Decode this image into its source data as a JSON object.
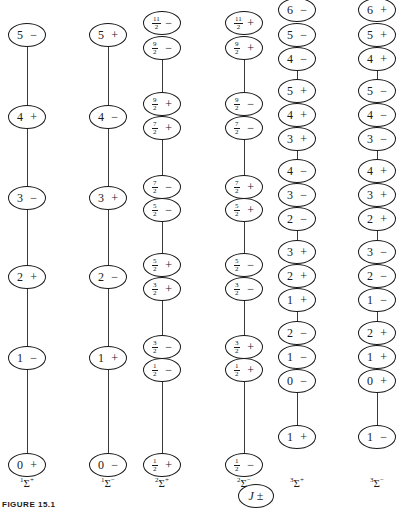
{
  "figure": {
    "caption": "FIGURE 15.1",
    "legend_node": "J ±"
  },
  "columns": [
    {
      "label": "Σ",
      "label_pre": "1",
      "label_post": "+",
      "x": 27,
      "levels": [
        {
          "j": "5",
          "p": "−",
          "y": 35
        },
        {
          "j": "4",
          "p": "+",
          "y": 117
        },
        {
          "j": "3",
          "p": "−",
          "y": 198
        },
        {
          "j": "2",
          "p": "+",
          "y": 277
        },
        {
          "j": "1",
          "p": "−",
          "y": 358
        },
        {
          "j": "0",
          "p": "+",
          "y": 465
        }
      ],
      "segments": [
        [
          35,
          465
        ]
      ]
    },
    {
      "label": "Σ",
      "label_pre": "1",
      "label_post": "−",
      "x": 108,
      "levels": [
        {
          "j": "5",
          "p": "+",
          "y": 35
        },
        {
          "j": "4",
          "p": "−",
          "y": 117
        },
        {
          "j": "3",
          "p": "+",
          "y": 198
        },
        {
          "j": "2",
          "p": "−",
          "y": 277
        },
        {
          "j": "1",
          "p": "+",
          "y": 358
        },
        {
          "j": "0",
          "p": "−",
          "y": 465
        }
      ],
      "segments": [
        [
          35,
          465
        ]
      ]
    },
    {
      "label": "Σ",
      "label_pre": "2",
      "label_post": "+",
      "x": 162,
      "levels": [
        {
          "j": "11/2",
          "p": "−",
          "y": 23
        },
        {
          "j": "9/2",
          "p": "−",
          "y": 48
        },
        {
          "j": "9/2",
          "p": "+",
          "y": 104
        },
        {
          "j": "7/2",
          "p": "+",
          "y": 128
        },
        {
          "j": "7/2",
          "p": "−",
          "y": 187
        },
        {
          "j": "5/2",
          "p": "−",
          "y": 210
        },
        {
          "j": "5/2",
          "p": "+",
          "y": 265
        },
        {
          "j": "3/2",
          "p": "+",
          "y": 289
        },
        {
          "j": "3/2",
          "p": "−",
          "y": 347
        },
        {
          "j": "1/2",
          "p": "−",
          "y": 370
        },
        {
          "j": "1/2",
          "p": "+",
          "y": 465
        }
      ],
      "segments": [
        [
          48,
          104
        ],
        [
          128,
          187
        ],
        [
          210,
          265
        ],
        [
          289,
          347
        ],
        [
          370,
          465
        ]
      ]
    },
    {
      "label": "Σ",
      "label_pre": "2",
      "label_post": "−",
      "x": 244,
      "levels": [
        {
          "j": "11/2",
          "p": "+",
          "y": 23
        },
        {
          "j": "9/2",
          "p": "+",
          "y": 48
        },
        {
          "j": "9/2",
          "p": "−",
          "y": 104
        },
        {
          "j": "7/2",
          "p": "−",
          "y": 128
        },
        {
          "j": "7/2",
          "p": "+",
          "y": 187
        },
        {
          "j": "5/2",
          "p": "+",
          "y": 210
        },
        {
          "j": "5/2",
          "p": "−",
          "y": 265
        },
        {
          "j": "3/2",
          "p": "−",
          "y": 289
        },
        {
          "j": "3/2",
          "p": "+",
          "y": 347
        },
        {
          "j": "1/2",
          "p": "+",
          "y": 370
        },
        {
          "j": "1/2",
          "p": "−",
          "y": 465
        }
      ],
      "segments": [
        [
          48,
          104
        ],
        [
          128,
          187
        ],
        [
          210,
          265
        ],
        [
          289,
          347
        ],
        [
          370,
          465
        ]
      ]
    },
    {
      "label": "Σ",
      "label_pre": "3",
      "label_post": "+",
      "x": 297,
      "levels": [
        {
          "j": "6",
          "p": "−",
          "y": 10
        },
        {
          "j": "5",
          "p": "−",
          "y": 35
        },
        {
          "j": "4",
          "p": "−",
          "y": 59
        },
        {
          "j": "5",
          "p": "+",
          "y": 91
        },
        {
          "j": "4",
          "p": "+",
          "y": 115
        },
        {
          "j": "3",
          "p": "+",
          "y": 139
        },
        {
          "j": "4",
          "p": "−",
          "y": 171
        },
        {
          "j": "3",
          "p": "−",
          "y": 195
        },
        {
          "j": "2",
          "p": "−",
          "y": 219
        },
        {
          "j": "3",
          "p": "+",
          "y": 252
        },
        {
          "j": "2",
          "p": "+",
          "y": 276
        },
        {
          "j": "1",
          "p": "+",
          "y": 300
        },
        {
          "j": "2",
          "p": "−",
          "y": 333
        },
        {
          "j": "1",
          "p": "−",
          "y": 357
        },
        {
          "j": "0",
          "p": "−",
          "y": 381
        },
        {
          "j": "1",
          "p": "+",
          "y": 437
        }
      ],
      "segments": [
        [
          59,
          91
        ],
        [
          139,
          171
        ],
        [
          219,
          252
        ],
        [
          300,
          333
        ],
        [
          381,
          437
        ]
      ]
    },
    {
      "label": "Σ",
      "label_pre": "3",
      "label_post": "−",
      "x": 377,
      "levels": [
        {
          "j": "6",
          "p": "+",
          "y": 10
        },
        {
          "j": "5",
          "p": "+",
          "y": 35
        },
        {
          "j": "4",
          "p": "+",
          "y": 59
        },
        {
          "j": "5",
          "p": "−",
          "y": 91
        },
        {
          "j": "4",
          "p": "−",
          "y": 115
        },
        {
          "j": "3",
          "p": "−",
          "y": 139
        },
        {
          "j": "4",
          "p": "+",
          "y": 171
        },
        {
          "j": "3",
          "p": "+",
          "y": 195
        },
        {
          "j": "2",
          "p": "+",
          "y": 219
        },
        {
          "j": "3",
          "p": "−",
          "y": 252
        },
        {
          "j": "2",
          "p": "−",
          "y": 276
        },
        {
          "j": "1",
          "p": "−",
          "y": 300
        },
        {
          "j": "2",
          "p": "+",
          "y": 333
        },
        {
          "j": "1",
          "p": "+",
          "y": 357
        },
        {
          "j": "0",
          "p": "+",
          "y": 381
        },
        {
          "j": "1",
          "p": "−",
          "y": 437
        }
      ],
      "segments": [
        [
          59,
          91
        ],
        [
          139,
          171
        ],
        [
          219,
          252
        ],
        [
          300,
          333
        ],
        [
          381,
          437
        ]
      ]
    }
  ]
}
